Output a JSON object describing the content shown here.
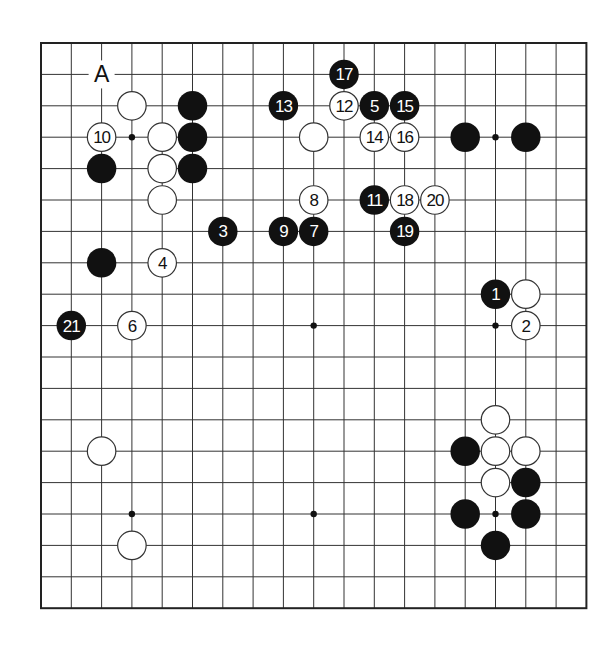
{
  "diagram": {
    "type": "go-board",
    "size": 19,
    "geometry": {
      "x0": 41,
      "y0": 43,
      "x1": 586.4,
      "y1": 608.2,
      "stone_diameter": 29.5,
      "border_width": 2,
      "line_width": 1,
      "line_color": "#333333",
      "black": "#111111",
      "white": "#ffffff"
    },
    "hoshi": [
      [
        4,
        4
      ],
      [
        10,
        4
      ],
      [
        16,
        4
      ],
      [
        4,
        10
      ],
      [
        10,
        10
      ],
      [
        16,
        10
      ],
      [
        4,
        16
      ],
      [
        10,
        16
      ],
      [
        16,
        16
      ]
    ],
    "labels": [
      {
        "text": "A",
        "col": 3,
        "row": 2
      }
    ],
    "stones": [
      {
        "color": "black",
        "col": 16,
        "row": 9,
        "move": "1"
      },
      {
        "color": "white",
        "col": 17,
        "row": 10,
        "move": "2"
      },
      {
        "color": "black",
        "col": 7,
        "row": 7,
        "move": "3"
      },
      {
        "color": "white",
        "col": 5,
        "row": 8,
        "move": "4"
      },
      {
        "color": "black",
        "col": 12,
        "row": 3,
        "move": "5"
      },
      {
        "color": "white",
        "col": 4,
        "row": 10,
        "move": "6"
      },
      {
        "color": "black",
        "col": 10,
        "row": 7,
        "move": "7"
      },
      {
        "color": "white",
        "col": 10,
        "row": 6,
        "move": "8"
      },
      {
        "color": "black",
        "col": 9,
        "row": 7,
        "move": "9"
      },
      {
        "color": "white",
        "col": 3,
        "row": 4,
        "move": "10"
      },
      {
        "color": "black",
        "col": 12,
        "row": 6,
        "move": "11"
      },
      {
        "color": "white",
        "col": 11,
        "row": 3,
        "move": "12"
      },
      {
        "color": "black",
        "col": 9,
        "row": 3,
        "move": "13"
      },
      {
        "color": "white",
        "col": 12,
        "row": 4,
        "move": "14"
      },
      {
        "color": "black",
        "col": 13,
        "row": 3,
        "move": "15"
      },
      {
        "color": "white",
        "col": 13,
        "row": 4,
        "move": "16"
      },
      {
        "color": "black",
        "col": 11,
        "row": 2,
        "move": "17"
      },
      {
        "color": "white",
        "col": 13,
        "row": 6,
        "move": "18"
      },
      {
        "color": "black",
        "col": 13,
        "row": 7,
        "move": "19"
      },
      {
        "color": "white",
        "col": 14,
        "row": 6,
        "move": "20"
      },
      {
        "color": "black",
        "col": 2,
        "row": 10,
        "move": "21"
      },
      {
        "color": "white",
        "col": 4,
        "row": 3,
        "move": ""
      },
      {
        "color": "black",
        "col": 6,
        "row": 3,
        "move": ""
      },
      {
        "color": "white",
        "col": 5,
        "row": 4,
        "move": ""
      },
      {
        "color": "black",
        "col": 6,
        "row": 4,
        "move": ""
      },
      {
        "color": "black",
        "col": 3,
        "row": 5,
        "move": ""
      },
      {
        "color": "white",
        "col": 5,
        "row": 5,
        "move": ""
      },
      {
        "color": "black",
        "col": 6,
        "row": 5,
        "move": ""
      },
      {
        "color": "white",
        "col": 5,
        "row": 6,
        "move": ""
      },
      {
        "color": "black",
        "col": 3,
        "row": 8,
        "move": ""
      },
      {
        "color": "white",
        "col": 10,
        "row": 4,
        "move": ""
      },
      {
        "color": "black",
        "col": 15,
        "row": 4,
        "move": ""
      },
      {
        "color": "black",
        "col": 17,
        "row": 4,
        "move": ""
      },
      {
        "color": "white",
        "col": 17,
        "row": 9,
        "move": ""
      },
      {
        "color": "white",
        "col": 3,
        "row": 14,
        "move": ""
      },
      {
        "color": "white",
        "col": 4,
        "row": 17,
        "move": ""
      },
      {
        "color": "white",
        "col": 16,
        "row": 13,
        "move": ""
      },
      {
        "color": "black",
        "col": 15,
        "row": 14,
        "move": ""
      },
      {
        "color": "white",
        "col": 16,
        "row": 14,
        "move": ""
      },
      {
        "color": "white",
        "col": 17,
        "row": 14,
        "move": ""
      },
      {
        "color": "white",
        "col": 16,
        "row": 15,
        "move": ""
      },
      {
        "color": "black",
        "col": 17,
        "row": 15,
        "move": ""
      },
      {
        "color": "black",
        "col": 15,
        "row": 16,
        "move": ""
      },
      {
        "color": "black",
        "col": 17,
        "row": 16,
        "move": ""
      },
      {
        "color": "black",
        "col": 16,
        "row": 17,
        "move": ""
      }
    ]
  }
}
